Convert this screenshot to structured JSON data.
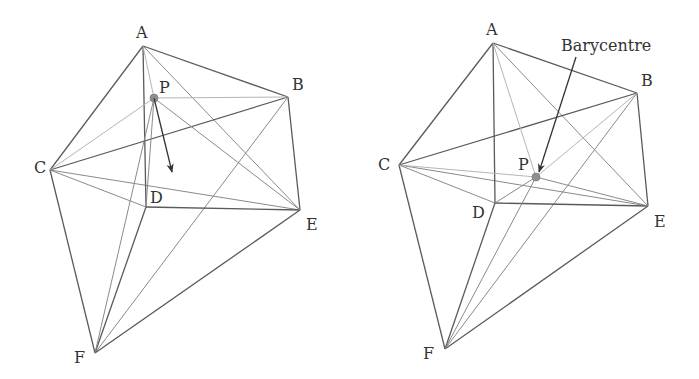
{
  "figures": [
    {
      "id": "left",
      "description": "Octahedron-like polyhedron with point P and a displacement arrow",
      "vertices": {
        "A": {
          "label": "A",
          "x": 143,
          "y": 46,
          "lx": 136,
          "ly": 38
        },
        "B": {
          "label": "B",
          "x": 288,
          "y": 97,
          "lx": 292,
          "ly": 90
        },
        "C": {
          "label": "C",
          "x": 50,
          "y": 170,
          "lx": 34,
          "ly": 173
        },
        "D": {
          "label": "D",
          "x": 146,
          "y": 207,
          "lx": 150,
          "ly": 203
        },
        "E": {
          "label": "E",
          "x": 300,
          "y": 210,
          "lx": 306,
          "ly": 230
        },
        "F": {
          "label": "F",
          "x": 95,
          "y": 353,
          "lx": 74,
          "ly": 363
        },
        "P": {
          "label": "P",
          "x": 154,
          "y": 98,
          "lx": 159,
          "ly": 93
        }
      },
      "arrow": {
        "from": [
          154,
          98
        ],
        "to": [
          172,
          172
        ]
      }
    },
    {
      "id": "right",
      "description": "Same polyhedron with P moved to the barycentre",
      "vertices": {
        "A": {
          "label": "A",
          "x": 493,
          "y": 43,
          "lx": 486,
          "ly": 35
        },
        "B": {
          "label": "B",
          "x": 637,
          "y": 93,
          "lx": 641,
          "ly": 86
        },
        "C": {
          "label": "C",
          "x": 399,
          "y": 165,
          "lx": 378,
          "ly": 170
        },
        "D": {
          "label": "D",
          "x": 495,
          "y": 203,
          "lx": 472,
          "ly": 218
        },
        "E": {
          "label": "E",
          "x": 648,
          "y": 206,
          "lx": 654,
          "ly": 227
        },
        "F": {
          "label": "F",
          "x": 445,
          "y": 349,
          "lx": 423,
          "ly": 359
        },
        "P": {
          "label": "P",
          "x": 536,
          "y": 177,
          "lx": 518,
          "ly": 170
        }
      },
      "annotation": {
        "text": "Barycentre",
        "x": 561,
        "y": 51,
        "arrow_from": [
          576,
          57
        ],
        "arrow_to": [
          539,
          172
        ]
      }
    }
  ],
  "colors": {
    "edge": "#5a5a5a",
    "hidden_edge": "#b5b5b5",
    "point": "#8f8f8f",
    "arrow": "#333333"
  }
}
